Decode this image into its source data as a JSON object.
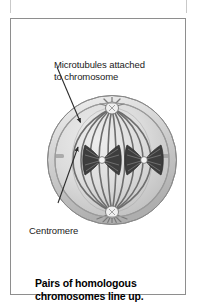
{
  "figure": {
    "caption": "Pairs of homologous\nchromosomes line up.",
    "labels": {
      "microtubules": "Microtubules attached\nto chromosome",
      "centromere": "Centromere"
    },
    "diagram": {
      "title": "Cell in metaphase I of meiosis",
      "parts": [
        "cell-membrane",
        "spindle-fibers",
        "centrosome-pole-top",
        "centrosome-pole-bottom",
        "homologous-chromosome-pair-left",
        "homologous-chromosome-pair-right",
        "centromere-left",
        "centromere-right"
      ]
    },
    "colors": {
      "cell_fill": "#d5d5d5",
      "cell_rim": "#b3b3b3",
      "cell_outline": "#8a8a8a",
      "spindle_fiber": "#6f6f6f",
      "chromosome_dark": "#3b3b3b",
      "chromosome_mid": "#707070",
      "centromere": "#f2f2f2",
      "label_text": "#1a1a1a",
      "caption_text": "#000000",
      "panel_border": "#8e8e8e",
      "leader_line": "#2b2b2b"
    }
  }
}
